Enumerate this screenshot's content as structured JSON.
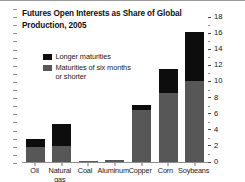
{
  "chart_data": {
    "type": "bar",
    "subtype": "stacked-bar",
    "title": "Futures Open Interests as Share of Global Production, 2005",
    "title_line1": "Futures Open Interests as Share of Global",
    "title_line2": "Production, 2005",
    "xlabel": "",
    "ylabel": "",
    "ylim": [
      0,
      18
    ],
    "yticks": [
      0,
      2,
      4,
      6,
      8,
      10,
      12,
      14,
      16,
      18
    ],
    "ytick_labels": [
      "0",
      "2",
      "4",
      "6",
      "8",
      "10",
      "12",
      "14",
      "16",
      "18"
    ],
    "y_axis_position": "right",
    "grid": false,
    "legend_position": "upper-left-inside",
    "categories": [
      "Oil",
      "Natural gas",
      "Coal",
      "Aluminum",
      "Copper",
      "Corn",
      "Soybeans"
    ],
    "series": [
      {
        "name": "Maturities of six months or shorter",
        "color": "#575757",
        "values": [
          1.9,
          2.0,
          0.05,
          0.3,
          6.5,
          8.6,
          10.0
        ]
      },
      {
        "name": "Longer maturities",
        "color": "#0d0d0d",
        "values": [
          0.9,
          2.7,
          0.0,
          0.0,
          0.6,
          2.9,
          6.2
        ]
      }
    ],
    "totals": [
      2.8,
      4.7,
      0.05,
      0.3,
      7.1,
      11.5,
      16.2
    ]
  },
  "legend": {
    "items": [
      {
        "label": "Longer maturities",
        "label_line2": "",
        "color": "#0d0d0d"
      },
      {
        "label": "Maturities of six months",
        "label_line2": "or shorter",
        "color": "#575757"
      }
    ]
  },
  "colors": {
    "long_maturities": "#0d0d0d",
    "short_maturities": "#575757",
    "axis": "#8d8d8d",
    "text": "#111111",
    "background": "#ffffff"
  }
}
